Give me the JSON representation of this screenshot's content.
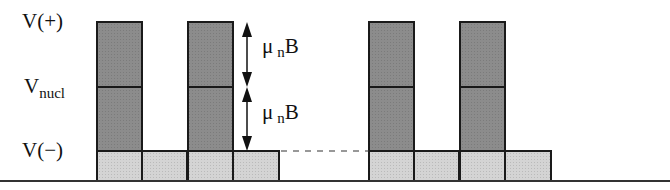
{
  "diagram": {
    "type": "energy-level-pulse-diagram",
    "levels": {
      "v_plus": {
        "label": "V(+)",
        "y": 22
      },
      "v_nucl": {
        "label_main": "V",
        "label_sub": "nucl",
        "y": 87
      },
      "v_minus": {
        "label": "V(−)",
        "y": 151
      },
      "baseline_y": 181
    },
    "splitting": [
      {
        "symbol": "μ",
        "subscript": "n",
        "suffix": "B",
        "from": "V(+)",
        "to": "V_nucl"
      },
      {
        "symbol": "μ",
        "subscript": "n",
        "suffix": "B",
        "from": "V_nucl",
        "to": "V(−)"
      }
    ],
    "tall_bars": [
      {
        "x": 97,
        "width": 45
      },
      {
        "x": 188,
        "width": 45
      },
      {
        "x": 369,
        "width": 45
      },
      {
        "x": 460,
        "width": 45
      }
    ],
    "short_bars": [
      {
        "x": 142,
        "width": 45
      },
      {
        "x": 233,
        "width": 46
      },
      {
        "x": 414,
        "width": 45
      },
      {
        "x": 505,
        "width": 46
      }
    ],
    "dashed_line": {
      "x1": 281,
      "x2": 369,
      "y": 151
    },
    "colors": {
      "dark_fill": "#8c8c8c",
      "light_fill": "#d4d4d4",
      "stroke": "#1a1a1a",
      "baseline": "#333333"
    }
  }
}
